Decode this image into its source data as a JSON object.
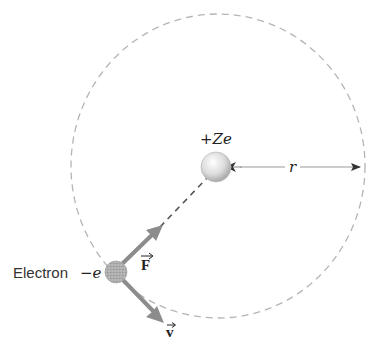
{
  "diagram": {
    "type": "bohr-atom-orbit",
    "nucleus": {
      "label": "+Ze",
      "cx": 216,
      "cy": 167,
      "r": 15
    },
    "electron": {
      "label": "Electron",
      "charge_label": "−e",
      "cx": 116,
      "cy": 272,
      "r": 11
    },
    "orbit": {
      "cx": 218,
      "cy": 166,
      "rx": 147,
      "ry": 152,
      "style": "dashed"
    },
    "radius_label": "r",
    "force_label": "F",
    "velocity_label": "v",
    "colors": {
      "orbit": "#b5b5b5",
      "arrow": "#8c8c8c",
      "radius_line": "#9a9a9a",
      "text": "#222222"
    }
  }
}
